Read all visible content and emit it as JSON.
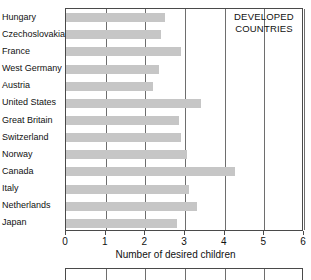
{
  "chart_data": {
    "type": "bar",
    "orientation": "horizontal",
    "title": "",
    "xlabel": "Number of desired children",
    "ylabel": "",
    "xlim": [
      0,
      6
    ],
    "xticks": [
      0,
      1,
      2,
      3,
      4,
      5,
      6
    ],
    "xtick_labels": [
      "0",
      "1",
      "2",
      "3",
      "4",
      "5",
      "6"
    ],
    "grid": true,
    "grid_axis": "x",
    "legend": null,
    "annotations": [
      {
        "text_lines": [
          "DEVELOPED",
          "COUNTRIES"
        ],
        "x": 5.0,
        "y": "top-right"
      }
    ],
    "bar_color": "#c6c6c6",
    "axis_color": "#4a4a4a",
    "categories": [
      "Hungary",
      "Czechoslovakia",
      "France",
      "West Germany",
      "Austria",
      "United States",
      "Great Britain",
      "Switzerland",
      "Norway",
      "Canada",
      "Italy",
      "Netherlands",
      "Japan"
    ],
    "values": [
      2.5,
      2.4,
      2.9,
      2.35,
      2.2,
      3.4,
      2.85,
      2.9,
      3.05,
      4.25,
      3.1,
      3.3,
      2.8
    ]
  }
}
